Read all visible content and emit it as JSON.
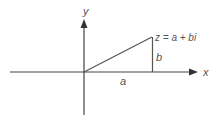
{
  "diagram": {
    "axes": {
      "x_label": "x",
      "y_label": "y"
    },
    "point": {
      "label": "z = a + bi"
    },
    "segments": {
      "horizontal_label": "a",
      "vertical_label": "b"
    },
    "colors": {
      "line": "#444444",
      "text": "#555555",
      "background": "#ffffff"
    }
  }
}
